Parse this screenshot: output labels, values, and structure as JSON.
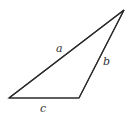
{
  "diagram": {
    "type": "triangle",
    "stroke_color": "#2a2a2a",
    "vertices": {
      "top_right": [
        124,
        10
      ],
      "bottom_left": [
        9,
        98
      ],
      "bottom_right": [
        79,
        98
      ]
    },
    "sides": [
      {
        "label": "a",
        "from": "bottom_left",
        "to": "top_right"
      },
      {
        "label": "b",
        "from": "bottom_right",
        "to": "top_right"
      },
      {
        "label": "c",
        "from": "bottom_left",
        "to": "bottom_right"
      }
    ]
  }
}
